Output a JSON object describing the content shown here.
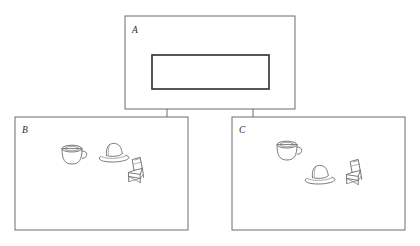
{
  "figure": {
    "type": "hand-drawn-diagram",
    "background_color": "#ffffff",
    "stroke_color": "#6d6d6d",
    "inner_rect_color": "#3a3a3a",
    "object_color": "#7a7a7a",
    "width": 420,
    "height": 246
  },
  "panels": [
    {
      "id": "A",
      "label": "A",
      "position": "top-center",
      "contains": "empty-rectangle",
      "objects": []
    },
    {
      "id": "B",
      "label": "B",
      "position": "bottom-left",
      "contains": "objects",
      "objects": [
        {
          "name": "cup",
          "icon": "cup-icon",
          "x": 72,
          "y": 154
        },
        {
          "name": "hat",
          "icon": "hat-icon",
          "x": 114,
          "y": 154
        },
        {
          "name": "chair",
          "icon": "chair-icon",
          "x": 137,
          "y": 172
        }
      ]
    },
    {
      "id": "C",
      "label": "C",
      "position": "bottom-right",
      "contains": "objects",
      "objects": [
        {
          "name": "cup",
          "icon": "cup-icon",
          "x": 287,
          "y": 150
        },
        {
          "name": "hat",
          "icon": "hat-icon",
          "x": 320,
          "y": 176
        },
        {
          "name": "chair",
          "icon": "chair-icon",
          "x": 355,
          "y": 174
        }
      ]
    }
  ],
  "connectors": [
    {
      "from": "A",
      "to": "B",
      "type": "line"
    },
    {
      "from": "A",
      "to": "C",
      "type": "line"
    }
  ]
}
